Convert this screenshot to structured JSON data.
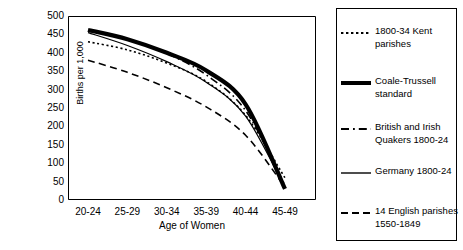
{
  "chart_data": {
    "type": "line",
    "title": "",
    "xlabel": "Age of Women",
    "ylabel": "Births per 1,000",
    "categories": [
      "20-24",
      "25-29",
      "30-34",
      "35-39",
      "40-44",
      "45-49"
    ],
    "ylim": [
      0,
      500
    ],
    "yticks": [
      0,
      50,
      100,
      150,
      200,
      250,
      300,
      350,
      400,
      450,
      500
    ],
    "ytick_labels": [
      "0",
      "50",
      "100",
      "150",
      "200",
      "250",
      "300",
      "350",
      "400",
      "450",
      "500"
    ],
    "y_minor_tick_step": 10,
    "grid": false,
    "legend_position": "right-outside",
    "series": [
      {
        "name": "1800-34 Kent parishes",
        "style": "dotted",
        "width": 1.6,
        "color": "#000000",
        "values": [
          430,
          408,
          372,
          322,
          230,
          60
        ]
      },
      {
        "name": "Coale-Trussell standard",
        "style": "solid",
        "width": 4.2,
        "color": "#000000",
        "values": [
          462,
          437,
          400,
          352,
          260,
          30
        ]
      },
      {
        "name": "British and Irish Quakers 1800-24",
        "style": "dashdot",
        "width": 1.6,
        "color": "#000000",
        "values": [
          460,
          437,
          398,
          340,
          243,
          40
        ]
      },
      {
        "name": "Germany 1800-24",
        "style": "solid",
        "width": 1.2,
        "color": "#000000",
        "values": [
          455,
          420,
          376,
          320,
          228,
          33
        ]
      },
      {
        "name": "14 English parishes 1550-1849",
        "style": "dashed",
        "width": 1.6,
        "color": "#000000",
        "values": [
          380,
          347,
          305,
          253,
          176,
          35
        ]
      }
    ]
  },
  "legend": {
    "entries": [
      {
        "label": "1800-34 Kent parishes",
        "style": "dotted"
      },
      {
        "label": "Coale-Trussell standard",
        "style": "solid-thick"
      },
      {
        "label": "British and Irish Quakers 1800-24",
        "style": "dashdot"
      },
      {
        "label": "Germany 1800-24",
        "style": "solid-thin"
      },
      {
        "label": "14 English parishes 1550-1849",
        "style": "dashed"
      }
    ]
  },
  "colors": {
    "ink": "#000000",
    "background": "#ffffff"
  }
}
